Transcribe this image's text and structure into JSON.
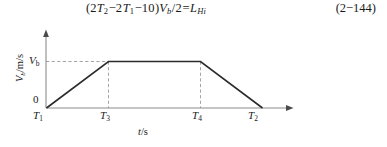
{
  "equation": {
    "number": "(2−144)",
    "tokens": [
      {
        "t": "(",
        "k": "plain"
      },
      {
        "t": "2",
        "k": "plain"
      },
      {
        "t": "T",
        "k": "var"
      },
      {
        "t": "2",
        "k": "sub"
      },
      {
        "t": "−2",
        "k": "op"
      },
      {
        "t": "T",
        "k": "var"
      },
      {
        "t": "1",
        "k": "sub"
      },
      {
        "t": "−10",
        "k": "op"
      },
      {
        "t": ")",
        "k": "plain"
      },
      {
        "t": "V",
        "k": "var"
      },
      {
        "t": "b",
        "k": "subi"
      },
      {
        "t": "/",
        "k": "slash"
      },
      {
        "t": "2",
        "k": "plain"
      },
      {
        "t": "=",
        "k": "op"
      },
      {
        "t": "L",
        "k": "var"
      },
      {
        "t": "Hi",
        "k": "subi"
      }
    ],
    "plain_text": "(2T2−2T1−10) Vb/2 = LHi"
  },
  "figure": {
    "y_axis_label": "Vᵇ/m/s",
    "y_axis_label_parts": {
      "symbol": "V",
      "subscript": "b",
      "units": "/m/s"
    },
    "x_axis_label": "t/s",
    "y_ticks": [
      {
        "id": "zero",
        "label": "0"
      },
      {
        "id": "vb",
        "label": "V",
        "subscript": "b"
      }
    ],
    "x_ticks": [
      {
        "id": "t1",
        "label": "T",
        "subscript": "1"
      },
      {
        "id": "t3",
        "label": "T",
        "subscript": "3"
      },
      {
        "id": "t4",
        "label": "T",
        "subscript": "4"
      },
      {
        "id": "t2",
        "label": "T",
        "subscript": "2"
      }
    ],
    "colors": {
      "axis": "#8c8c8c",
      "curve": "#2b2b2b",
      "dashed": "#9a9a9a",
      "text": "#1a1a1a",
      "background": "#ffffff"
    }
  },
  "chart_data": {
    "type": "line",
    "title": "",
    "subtitle": "",
    "xlabel": "t/s",
    "ylabel": "V_b/m/s",
    "grid": false,
    "legend": null,
    "x_tick_labels": [
      "T1",
      "T3",
      "T4",
      "T2"
    ],
    "y_tick_labels": [
      "0",
      "V_b"
    ],
    "xlim": [
      "T1",
      "T2"
    ],
    "ylim": [
      0,
      "V_b"
    ],
    "series": [
      {
        "name": "velocity",
        "points": [
          {
            "x": "T1",
            "y": 0
          },
          {
            "x": "T3",
            "y": "V_b"
          },
          {
            "x": "T4",
            "y": "V_b"
          },
          {
            "x": "T2",
            "y": 0
          }
        ]
      }
    ],
    "annotations": [
      {
        "type": "dashed-horizontal",
        "at": "V_b",
        "from": "y-axis",
        "to": "T3"
      },
      {
        "type": "dashed-vertical",
        "at": "T3",
        "from": "0",
        "to": "V_b"
      },
      {
        "type": "dashed-vertical",
        "at": "T4",
        "from": "0",
        "to": "V_b"
      }
    ]
  }
}
